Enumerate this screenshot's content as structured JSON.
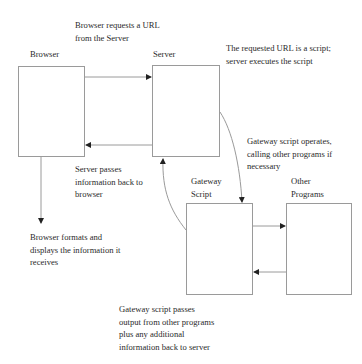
{
  "diagram": {
    "nodes": {
      "browser": {
        "label": "Browser"
      },
      "server": {
        "label": "Server"
      },
      "gateway": {
        "label": "Gateway\nScript"
      },
      "other": {
        "label": "Other\nPrograms"
      }
    },
    "annotations": {
      "request": "Browser requests a URL\nfrom the Server",
      "executes": "The requested URL is a script;\nserver executes the script",
      "operates": "Gateway script operates,\ncalling other programs if\nnecessary",
      "passes_back": "Server passes\ninformation back to\nbrowser",
      "displays": "Browser formats and\ndisplays the information it\nreceives",
      "gateway_passes": "Gateway script passes\noutput from other programs\nplus any additional\ninformation back to server"
    },
    "edges": [
      {
        "from": "browser",
        "to": "server",
        "meaning": "request URL"
      },
      {
        "from": "server",
        "to": "browser",
        "meaning": "pass information back"
      },
      {
        "from": "server",
        "to": "gateway",
        "meaning": "execute script"
      },
      {
        "from": "gateway",
        "to": "server",
        "meaning": "pass output back"
      },
      {
        "from": "gateway",
        "to": "other",
        "meaning": "call other programs"
      },
      {
        "from": "other",
        "to": "gateway",
        "meaning": "return output"
      },
      {
        "from": "browser",
        "to": "display",
        "meaning": "format and display"
      }
    ],
    "colors": {
      "line": "#9a9a9a",
      "arrowhead": "#222222",
      "text": "#2a2a2a"
    }
  }
}
